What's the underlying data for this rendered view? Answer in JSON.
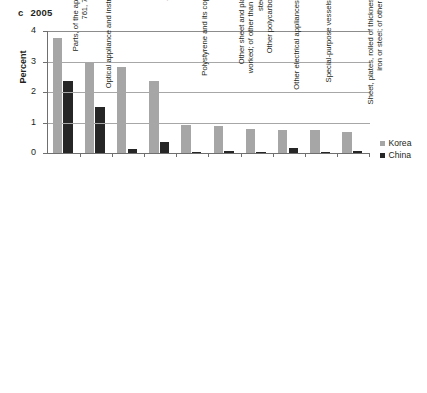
{
  "panel": {
    "letter": "c",
    "year": "2005"
  },
  "legend": {
    "position": "right",
    "items": [
      {
        "label": "Korea",
        "color": "#a6a6a6"
      },
      {
        "label": "China",
        "color": "#262626"
      }
    ]
  },
  "axis": {
    "y_title": "Percent",
    "y_ticks": [
      "0",
      "1",
      "2",
      "3",
      "4"
    ]
  },
  "chart_data": {
    "type": "bar",
    "xlabel": "",
    "ylabel": "Percent",
    "ylim": [
      0,
      4
    ],
    "yticks": [
      0,
      1,
      2,
      3,
      4
    ],
    "grid": true,
    "legend_position": "right",
    "categories": [
      "Parts, of the apparatus of headings\n761, 762, 7643, and 7648",
      "Optical appliance and instruments, nes; lasers\n(other than diodes)",
      "Tankers of all kinds",
      "Other cargo vessels",
      "Polystyrene and its copolymers, in primary\nforms",
      "Other sheet and plates, of iron or steel,\nworked; of other than high-carbon or alloy\nsteel (excluding tinned)",
      "Other polycarboxylic acids and their\nderivatives",
      "Other electrical appliances and apparatus, nes",
      "Special-purpose vessels, floating docks, etc.",
      "Sheet, plates, rolled of thickness less than 3mm, of\niron or steel; of other than high-carbon or\nalloy steel"
    ],
    "series": [
      {
        "name": "Korea",
        "color": "#a6a6a6",
        "values": [
          3.76,
          2.99,
          2.82,
          2.36,
          0.93,
          0.87,
          0.79,
          0.75,
          0.74,
          0.7
        ]
      },
      {
        "name": "China",
        "color": "#262626",
        "values": [
          2.37,
          1.5,
          0.13,
          0.36,
          0.02,
          0.08,
          0.02,
          0.17,
          0.02,
          0.06
        ]
      }
    ]
  }
}
